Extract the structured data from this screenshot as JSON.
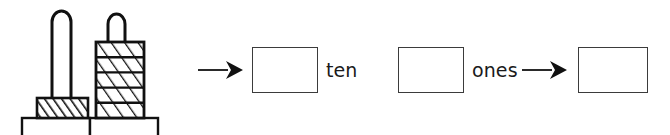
{
  "worksheet": {
    "kind": "place-value-blocks-exercise",
    "labels": {
      "ten": "ten",
      "ones": "ones"
    },
    "answer_boxes": [
      {
        "name": "tens-answer-box",
        "value": "",
        "placeholder": ""
      },
      {
        "name": "ones-answer-box",
        "value": "",
        "placeholder": ""
      },
      {
        "name": "total-answer-box",
        "value": "",
        "placeholder": ""
      }
    ],
    "arrows": [
      {
        "name": "arrow-to-tens",
        "direction": "right"
      },
      {
        "name": "arrow-to-total",
        "direction": "right"
      }
    ],
    "manipulative": {
      "name": "base-ten-rod-and-cube-stack",
      "left_column": {
        "name": "ten-rod",
        "loop_count": 1,
        "block_count": 1,
        "description": "tall thin rod loop on single hatched block"
      },
      "right_column": {
        "name": "ones-cube-stack",
        "loop_count": 1,
        "block_count": 5,
        "description": "short loop on stack of five hatched unit blocks"
      },
      "platforms": 2
    },
    "colors": {
      "ink": "#1a1a1a",
      "box_border": "#3b3b3b",
      "paper": "#ffffff"
    }
  }
}
